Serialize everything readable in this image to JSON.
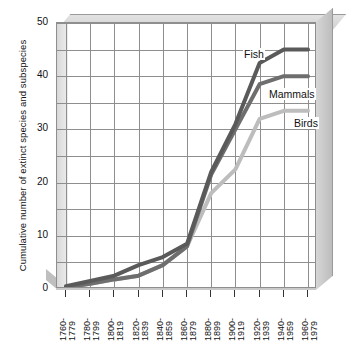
{
  "chart_data": {
    "type": "line",
    "title": "",
    "xlabel": "",
    "ylabel": "Cumulative number of extinct species and subspecies",
    "ylim": [
      0,
      50
    ],
    "yticks": [
      0,
      10,
      20,
      30,
      40,
      50
    ],
    "ytick_labels": [
      "0",
      "10",
      "20",
      "30",
      "40",
      "50"
    ],
    "grid": true,
    "grid_minor_step": 5,
    "legend_position": "inline-right",
    "categories": [
      "1760-1779",
      "1780-1799",
      "1800-1819",
      "1820-1839",
      "1840-1859",
      "1860-1879",
      "1880-1899",
      "1900-1919",
      "1920-1939",
      "1940-1959",
      "1960-1979"
    ],
    "category_lines": [
      {
        "top": "1760-",
        "bottom": "1779"
      },
      {
        "top": "1780-",
        "bottom": "1799"
      },
      {
        "top": "1800-",
        "bottom": "1819"
      },
      {
        "top": "1820-",
        "bottom": "1839"
      },
      {
        "top": "1840-",
        "bottom": "1859"
      },
      {
        "top": "1860-",
        "bottom": "1879"
      },
      {
        "top": "1880-",
        "bottom": "1899"
      },
      {
        "top": "1900-",
        "bottom": "1919"
      },
      {
        "top": "1920-",
        "bottom": "1939"
      },
      {
        "top": "1940-",
        "bottom": "1959"
      },
      {
        "top": "1960-",
        "bottom": "1979"
      }
    ],
    "series": [
      {
        "name": "Fish",
        "color": "#5a5a5a",
        "values": [
          0.5,
          1.5,
          2.5,
          4.5,
          6.0,
          8.5,
          22.0,
          31.0,
          42.5,
          45.0,
          45.0
        ]
      },
      {
        "name": "Mammals",
        "color": "#6e6e6e",
        "values": [
          0.3,
          1.0,
          1.8,
          2.5,
          4.5,
          8.0,
          21.5,
          30.0,
          38.5,
          40.0,
          40.0
        ]
      },
      {
        "name": "Birds",
        "color": "#bdbdbd",
        "values": [
          0.3,
          1.0,
          1.8,
          2.5,
          4.5,
          8.0,
          18.0,
          22.5,
          32.0,
          33.5,
          33.5
        ]
      }
    ]
  },
  "series_labels": [
    {
      "name": "Fish",
      "text": "Fish"
    },
    {
      "name": "Mammals",
      "text": "Mammals"
    },
    {
      "name": "Birds",
      "text": "Birds"
    }
  ],
  "colors": {
    "fish": "#5a5a5a",
    "mammals": "#6e6e6e",
    "birds": "#bdbdbd",
    "grid": "#8e8e8e",
    "wall": "#d6d6d6",
    "background": "#ffffff"
  }
}
